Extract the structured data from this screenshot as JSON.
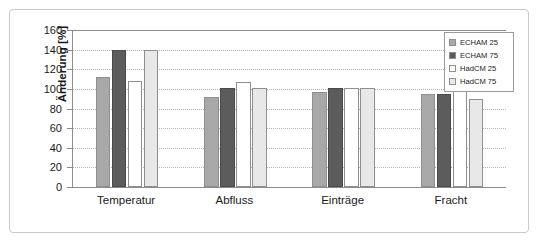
{
  "chart_data": {
    "type": "bar",
    "title": "",
    "xlabel": "",
    "ylabel": "Änderung [%]",
    "categories": [
      "Temperatur",
      "Abfluss",
      "Einträge",
      "Fracht"
    ],
    "series": [
      {
        "name": "ECHAM 25",
        "color": "#a8a8a8",
        "values": [
          112,
          92,
          97,
          95
        ]
      },
      {
        "name": "ECHAM 75",
        "color": "#5c5c5c",
        "values": [
          140,
          101,
          101,
          95
        ]
      },
      {
        "name": "HadCM 25",
        "color": "#ffffff",
        "values": [
          108,
          107,
          101,
          101
        ]
      },
      {
        "name": "HadCM 75",
        "color": "#e8e8e8",
        "values": [
          140,
          101,
          101,
          90
        ]
      }
    ],
    "ylim": [
      0,
      160
    ],
    "yticks": [
      0,
      20,
      40,
      60,
      80,
      100,
      120,
      140,
      160
    ],
    "ytick_labels": [
      "0",
      "20",
      "40",
      "60",
      "80",
      "100",
      "120",
      "140",
      "160"
    ],
    "grid": true,
    "legend_position": "top-right"
  },
  "legend": {
    "entries": [
      "ECHAM 25",
      "ECHAM 75",
      "HadCM 25",
      "HadCM 75"
    ]
  }
}
